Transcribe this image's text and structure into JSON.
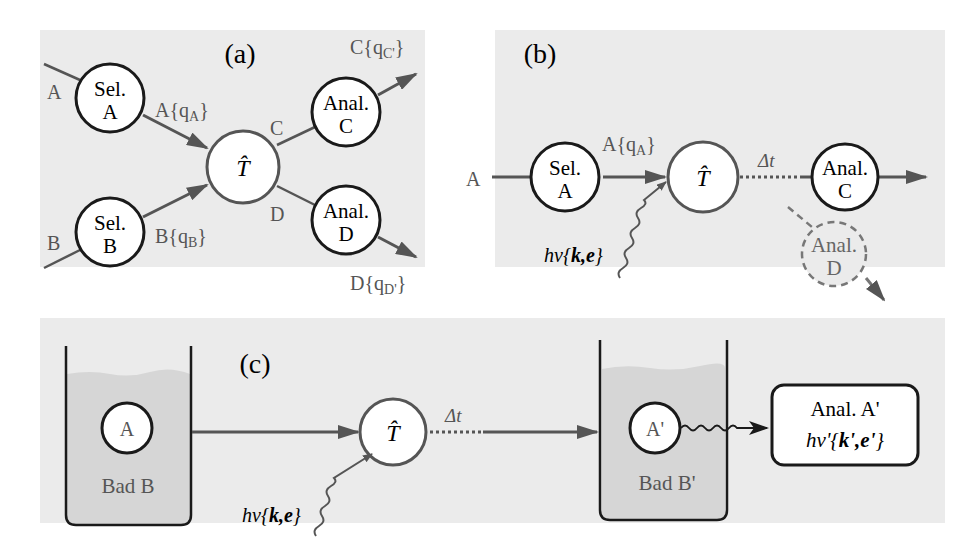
{
  "figure": {
    "panels": [
      {
        "id": "a",
        "label": "(a)",
        "inputs": [
          {
            "beam": "A",
            "selector": {
              "line1": "Sel.",
              "line2": "A"
            },
            "output": "A{q",
            "output_sub": "A",
            "output_close": "}"
          },
          {
            "beam": "B",
            "selector": {
              "line1": "Sel.",
              "line2": "B"
            },
            "output": "B{q",
            "output_sub": "B",
            "output_close": "}"
          }
        ],
        "target": "T̂",
        "outputs": [
          {
            "beam": "C",
            "analyzer": {
              "line1": "Anal.",
              "line2": "C"
            },
            "result": "C{q",
            "result_sub": "C'",
            "result_close": "}"
          },
          {
            "beam": "D",
            "analyzer": {
              "line1": "Anal.",
              "line2": "D"
            },
            "result": "D{q",
            "result_sub": "D'",
            "result_close": "}"
          }
        ]
      },
      {
        "id": "b",
        "label": "(b)",
        "beam_in": "A",
        "selector": {
          "line1": "Sel.",
          "line2": "A"
        },
        "selector_output": "A{q",
        "selector_output_sub": "A",
        "selector_output_close": "}",
        "photon": {
          "prefix": "hv{",
          "vars": "k,e",
          "suffix": "}"
        },
        "target": "T̂",
        "delay": "Δt",
        "analyzer_c": {
          "line1": "Anal.",
          "line2": "C"
        },
        "analyzer_d": {
          "line1": "Anal.",
          "line2": "D",
          "style": "dashed"
        }
      },
      {
        "id": "c",
        "label": "(c)",
        "bath_in": {
          "particle": "A",
          "label": "Bad B"
        },
        "photon": {
          "prefix": "hv{",
          "vars": "k,e",
          "suffix": "}"
        },
        "target": "T̂",
        "delay": "Δt",
        "bath_out": {
          "particle": "A'",
          "label": "Bad B'"
        },
        "analyzer_box": {
          "line1": "Anal. A'",
          "line2_prefix": "hv'{",
          "line2_vars": "k',e'",
          "line2_suffix": "}"
        }
      }
    ],
    "colors": {
      "panel_bg": "#ebebeb",
      "bath_fill": "#d6d6d6",
      "stroke_dark": "#1a1a1a",
      "stroke_gray": "#555555",
      "text_gray": "#555555"
    }
  }
}
